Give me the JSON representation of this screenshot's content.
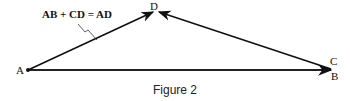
{
  "figure": {
    "caption": "Figure 2",
    "equation": "AB + CD = AD",
    "points": {
      "A": "A",
      "B": "B",
      "C": "C",
      "D": "D"
    },
    "vectors": [
      {
        "name": "AB",
        "from": "A",
        "to": "B"
      },
      {
        "name": "CD",
        "from": "C",
        "to": "D"
      },
      {
        "name": "AD",
        "from": "A",
        "to": "D"
      }
    ]
  }
}
